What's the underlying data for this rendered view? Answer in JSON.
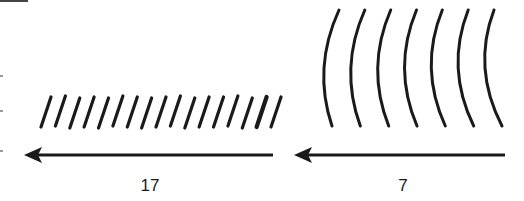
{
  "panels": [
    {
      "name": "short-wavelength",
      "label": "17",
      "mark_count": 17,
      "mark_shape": "slanted-stroke"
    },
    {
      "name": "long-wavelength",
      "label": "7",
      "mark_count": 7,
      "mark_shape": "arc"
    }
  ],
  "colors": {
    "ink": "#1a1a1a",
    "background": "#ffffff"
  }
}
